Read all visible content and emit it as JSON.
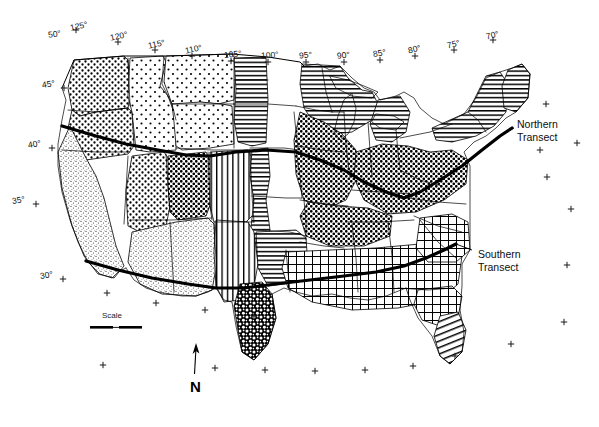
{
  "figure": {
    "type": "thematic-map",
    "region": "Conterminous United States",
    "background_color": "#ffffff",
    "line_color": "#000000",
    "width": 599,
    "height": 427
  },
  "graticule": {
    "longitude_labels": [
      {
        "text": "125°",
        "x": 70,
        "y": 22,
        "rot": -12
      },
      {
        "text": "120°",
        "x": 110,
        "y": 32,
        "rot": -12
      },
      {
        "text": "115°",
        "x": 148,
        "y": 40,
        "rot": -12
      },
      {
        "text": "110°",
        "x": 185,
        "y": 45,
        "rot": -12
      },
      {
        "text": "105°",
        "x": 224,
        "y": 50,
        "rot": -6
      },
      {
        "text": "100°",
        "x": 261,
        "y": 51,
        "rot": -4
      },
      {
        "text": "95°",
        "x": 299,
        "y": 51,
        "rot": -4
      },
      {
        "text": "90°",
        "x": 337,
        "y": 51,
        "rot": -6
      },
      {
        "text": "85°",
        "x": 373,
        "y": 49,
        "rot": -10
      },
      {
        "text": "80°",
        "x": 408,
        "y": 45,
        "rot": -14
      },
      {
        "text": "75°",
        "x": 447,
        "y": 40,
        "rot": -14
      },
      {
        "text": "70°",
        "x": 486,
        "y": 31,
        "rot": -14
      }
    ],
    "latitude_labels": [
      {
        "text": "50°",
        "x": 48,
        "y": 30,
        "rot": -8
      },
      {
        "text": "45°",
        "x": 42,
        "y": 80,
        "rot": -10
      },
      {
        "text": "40°",
        "x": 28,
        "y": 140,
        "rot": -10
      },
      {
        "text": "35°",
        "x": 12,
        "y": 196,
        "rot": -10
      },
      {
        "text": "30°",
        "x": 40,
        "y": 271,
        "rot": -10
      }
    ],
    "tick_marks": [
      {
        "x": 76,
        "y": 30
      },
      {
        "x": 118,
        "y": 42
      },
      {
        "x": 155,
        "y": 50
      },
      {
        "x": 192,
        "y": 56
      },
      {
        "x": 231,
        "y": 61
      },
      {
        "x": 268,
        "y": 62
      },
      {
        "x": 306,
        "y": 62
      },
      {
        "x": 344,
        "y": 62
      },
      {
        "x": 380,
        "y": 60
      },
      {
        "x": 415,
        "y": 56
      },
      {
        "x": 454,
        "y": 50
      },
      {
        "x": 493,
        "y": 40
      },
      {
        "x": 64,
        "y": 88
      },
      {
        "x": 547,
        "y": 177
      },
      {
        "x": 52,
        "y": 148
      },
      {
        "x": 571,
        "y": 209
      },
      {
        "x": 36,
        "y": 204
      },
      {
        "x": 567,
        "y": 265
      },
      {
        "x": 63,
        "y": 279
      },
      {
        "x": 564,
        "y": 322
      },
      {
        "x": 107,
        "y": 293
      },
      {
        "x": 156,
        "y": 303
      },
      {
        "x": 205,
        "y": 310
      },
      {
        "x": 254,
        "y": 316
      },
      {
        "x": 103,
        "y": 365
      },
      {
        "x": 215,
        "y": 368
      },
      {
        "x": 265,
        "y": 370
      },
      {
        "x": 315,
        "y": 371
      },
      {
        "x": 365,
        "y": 370
      },
      {
        "x": 413,
        "y": 366
      },
      {
        "x": 455,
        "y": 356
      },
      {
        "x": 511,
        "y": 344
      },
      {
        "x": 546,
        "y": 104
      },
      {
        "x": 540,
        "y": 150
      },
      {
        "x": 577,
        "y": 143
      }
    ]
  },
  "annotations": {
    "northern_transect": {
      "line1": "Northern",
      "line2": "Transect",
      "x": 517,
      "y": 118
    },
    "southern_transect": {
      "line1": "Southern",
      "line2": "Transect",
      "x": 478,
      "y": 248
    }
  },
  "scale_bar": {
    "label": "Scale",
    "label_x": 102,
    "label_y": 311,
    "bar_x": 90,
    "bar_y": 326,
    "bar_length": 52
  },
  "north_arrow": {
    "label": "N",
    "label_x": 190,
    "label_y": 378,
    "shaft_x": 196,
    "shaft_top": 348,
    "shaft_bottom": 374
  },
  "legend_patterns": [
    {
      "name": "coarse-dots",
      "description": "Widely spaced dot stipple"
    },
    {
      "name": "medium-dots",
      "description": "Medium density dot stipple"
    },
    {
      "name": "dense-dots",
      "description": "High density dot stipple"
    },
    {
      "name": "fine-speckle",
      "description": "Fine random speckle"
    },
    {
      "name": "heavy-blob",
      "description": "Heavy dark blob stipple"
    },
    {
      "name": "horizontal-lines",
      "description": "Horizontal line hatch"
    },
    {
      "name": "vertical-lines",
      "description": "Vertical line hatch"
    },
    {
      "name": "crosshatch",
      "description": "Square grid crosshatch"
    },
    {
      "name": "diagonal-lines",
      "description": "Diagonal line hatch"
    },
    {
      "name": "blank",
      "description": "Unpatterned white"
    }
  ]
}
